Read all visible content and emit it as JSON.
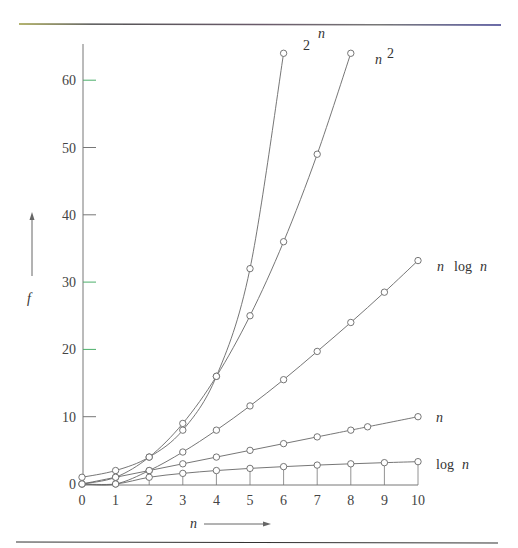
{
  "chart_data": {
    "type": "line",
    "title": "",
    "xlabel": "n",
    "ylabel": "f",
    "xlim": [
      0,
      10
    ],
    "ylim": [
      0,
      64
    ],
    "x_ticks": [
      0,
      1,
      2,
      3,
      4,
      5,
      6,
      7,
      8,
      9,
      10
    ],
    "y_ticks": [
      0,
      10,
      20,
      30,
      40,
      50,
      60
    ],
    "grid": false,
    "legend_position": "inline-labels-at-curve-ends",
    "series": [
      {
        "name": "2^n",
        "label_base": "2",
        "label_sup": "n",
        "x": [
          0,
          1,
          2,
          3,
          4,
          5,
          6
        ],
        "values": [
          1,
          2,
          4,
          8,
          16,
          32,
          64
        ]
      },
      {
        "name": "n^2",
        "label_base": "n",
        "label_sup": "2",
        "x": [
          0,
          1,
          2,
          3,
          4,
          5,
          6,
          7,
          8
        ],
        "values": [
          0,
          1,
          4,
          9,
          16,
          25,
          36,
          49,
          64
        ]
      },
      {
        "name": "n log n",
        "label_base": "n  log n",
        "label_sup": "",
        "x": [
          0,
          1,
          2,
          3,
          4,
          5,
          6,
          7,
          8,
          9,
          10
        ],
        "values": [
          0,
          0,
          2,
          4.75,
          8,
          11.6,
          15.5,
          19.7,
          24,
          28.5,
          33.2
        ]
      },
      {
        "name": "n",
        "label_base": "n",
        "label_sup": "",
        "x": [
          0,
          1,
          2,
          3,
          4,
          5,
          6,
          7,
          8,
          8.5,
          10
        ],
        "values": [
          0,
          1,
          2,
          3,
          4,
          5,
          6,
          7,
          8,
          8.5,
          10
        ]
      },
      {
        "name": "log n",
        "label_base": "log n",
        "label_sup": "",
        "x": [
          1,
          2,
          3,
          4,
          5,
          6,
          7,
          8,
          9,
          10
        ],
        "values": [
          0,
          1,
          1.58,
          2,
          2.32,
          2.58,
          2.81,
          3,
          3.17,
          3.32
        ]
      }
    ],
    "annotations": [
      "f ↑ (vertical axis arrow)",
      "n → (horizontal axis arrow)"
    ]
  },
  "labels": {
    "y_axis": "f",
    "x_axis": "n",
    "two_n_base": "2",
    "two_n_sup": "n",
    "n_sq_base": "n",
    "n_sq_sup": "2",
    "nlogn_n": "n",
    "nlogn_log": "log",
    "nlogn_n2": "n",
    "n_label": "n",
    "logn_log": "log",
    "logn_n": "n"
  },
  "colors": {
    "axis": "#555555",
    "curve": "#666666",
    "marker": "#666666",
    "rule": "#333333",
    "tick_green": "#4caf6a"
  }
}
